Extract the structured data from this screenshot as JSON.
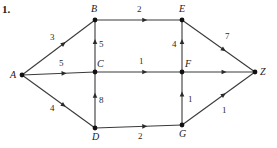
{
  "figure": {
    "problem_number": "1.",
    "graph_type": "directed-weighted-graph",
    "nodes": [
      {
        "id": "A",
        "label": "A",
        "x": 22,
        "y": 75,
        "label_dx": -12,
        "label_dy": -5
      },
      {
        "id": "B",
        "label": "B",
        "x": 95,
        "y": 20,
        "label_dx": -4,
        "label_dy": -16
      },
      {
        "id": "C",
        "label": "C",
        "x": 95,
        "y": 72,
        "label_dx": 2,
        "label_dy": -13
      },
      {
        "id": "D",
        "label": "D",
        "x": 95,
        "y": 128,
        "label_dx": -3,
        "label_dy": 4
      },
      {
        "id": "E",
        "label": "E",
        "x": 182,
        "y": 20,
        "label_dx": -3,
        "label_dy": -16
      },
      {
        "id": "F",
        "label": "F",
        "x": 182,
        "y": 72,
        "label_dx": 3,
        "label_dy": -13
      },
      {
        "id": "G",
        "label": "G",
        "x": 182,
        "y": 125,
        "label_dx": -3,
        "label_dy": 4
      },
      {
        "id": "Z",
        "label": "Z",
        "x": 255,
        "y": 72,
        "label_dx": 5,
        "label_dy": -5
      }
    ],
    "edges": [
      {
        "from": "A",
        "to": "B",
        "weight": "3",
        "label_x": 50,
        "label_y": 33
      },
      {
        "from": "A",
        "to": "C",
        "weight": "5",
        "label_x": 59,
        "label_y": 59
      },
      {
        "from": "A",
        "to": "D",
        "weight": "4",
        "label_x": 50,
        "label_y": 104
      },
      {
        "from": "C",
        "to": "B",
        "weight": "5",
        "label_x": 99,
        "label_y": 40
      },
      {
        "from": "D",
        "to": "C",
        "weight": "8",
        "label_x": 99,
        "label_y": 96
      },
      {
        "from": "B",
        "to": "E",
        "weight": "2",
        "label_x": 137,
        "label_y": 5
      },
      {
        "from": "C",
        "to": "F",
        "weight": "1",
        "label_x": 139,
        "label_y": 57
      },
      {
        "from": "D",
        "to": "G",
        "weight": "2",
        "label_x": 138,
        "label_y": 132
      },
      {
        "from": "F",
        "to": "E",
        "weight": "4",
        "label_x": 172,
        "label_y": 40
      },
      {
        "from": "G",
        "to": "F",
        "weight": "1",
        "label_x": 188,
        "label_y": 95
      },
      {
        "from": "E",
        "to": "Z",
        "weight": "7",
        "label_x": 225,
        "label_y": 32
      },
      {
        "from": "F",
        "to": "Z",
        "weight": "",
        "label_x": 218,
        "label_y": 57
      },
      {
        "from": "G",
        "to": "Z",
        "weight": "1",
        "label_x": 222,
        "label_y": 106
      }
    ],
    "colors": {
      "edge_stroke": "#3a3a3a",
      "node_fill": "#111111",
      "text": "#1a1a1a",
      "background": "#ffffff"
    }
  }
}
